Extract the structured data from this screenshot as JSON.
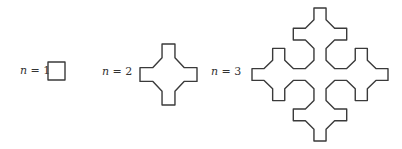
{
  "figure": {
    "colors": {
      "stroke": "#3a3a3a",
      "text": "#333333",
      "background": "#ffffff"
    },
    "items": [
      {
        "label_var": "n",
        "label_eq": " = 1",
        "order": 1,
        "box": [
          48,
          62,
          17,
          18
        ],
        "label_pos": [
          20,
          64
        ]
      },
      {
        "label_var": "n",
        "label_eq": " = 2",
        "order": 2,
        "box": [
          140,
          44,
          57,
          61
        ],
        "label_pos": [
          102,
          65
        ]
      },
      {
        "label_var": "n",
        "label_eq": " = 3",
        "order": 3,
        "box": [
          252,
          8,
          136,
          133
        ],
        "label_pos": [
          211,
          65
        ]
      }
    ]
  }
}
